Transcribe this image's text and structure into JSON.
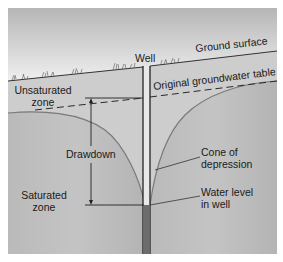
{
  "diagram": {
    "labels": {
      "well": "Well",
      "ground_surface": "Ground surface",
      "original_water_table": "Original groundwater table",
      "unsaturated_zone_line1": "Unsaturated",
      "unsaturated_zone_line2": "zone",
      "drawdown": "Drawdown",
      "cone_line1": "Cone of",
      "cone_line2": "depression",
      "saturated_zone_line1": "Saturated",
      "saturated_zone_line2": "zone",
      "water_level_line1": "Water level",
      "water_level_line2": "in well"
    },
    "colors": {
      "sky_top": "#b9b9b9",
      "sky_bottom": "#f4f4f4",
      "unsaturated": "#cfcfcf",
      "saturated": "#bdbdbd",
      "cone_line": "#7a7a7a",
      "well_water": "#6d6d6d",
      "ink": "#1a1a1a"
    }
  }
}
